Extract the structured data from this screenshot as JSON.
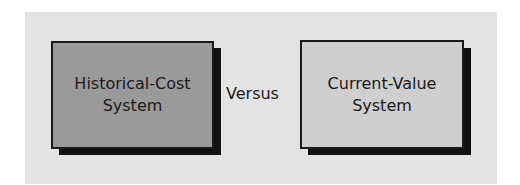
{
  "diagram": {
    "left_box": {
      "line1": "Historical-Cost",
      "line2": "System",
      "fill": "#9a9a9a"
    },
    "connector": {
      "label": "Versus"
    },
    "right_box": {
      "line1": "Current-Value",
      "line2": "System",
      "fill": "#cfcfcf"
    },
    "panel_color": "#e3e3e3",
    "shadow_color": "#111111"
  }
}
